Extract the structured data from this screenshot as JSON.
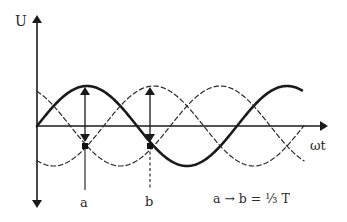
{
  "diagram": {
    "axes": {
      "y_label": "U",
      "x_label": "ωt",
      "origin": {
        "x": 37,
        "y": 126
      },
      "y_top": 15,
      "y_bottom": 208,
      "x_end": 328
    },
    "curves": [
      {
        "name": "phase-1",
        "style": "solid",
        "phase_deg": 0,
        "amplitude_px": 40,
        "period_px": 200,
        "x_start": 37,
        "x_end": 302,
        "color": "#1a1a1a",
        "width": 2.6
      },
      {
        "name": "phase-2",
        "style": "dashed",
        "phase_deg": 120,
        "amplitude_px": 40,
        "period_px": 200,
        "x_start": 37,
        "x_end": 304,
        "color": "#2a2a2a",
        "width": 1.2
      },
      {
        "name": "phase-3",
        "style": "dashed",
        "phase_deg": -120,
        "amplitude_px": 40,
        "period_px": 200,
        "x_start": 37,
        "x_end": 304,
        "color": "#2a2a2a",
        "width": 1.2
      }
    ],
    "markers": [
      {
        "label": "a",
        "x": 85,
        "dot_y": 146,
        "arrow_top": 86,
        "arrow_bottom": 142,
        "line_bottom": 190,
        "line_style": "solid"
      },
      {
        "label": "b",
        "x": 150,
        "dot_y": 146,
        "arrow_top": 86,
        "arrow_bottom": 142,
        "line_bottom": 190,
        "line_style": "dashed"
      }
    ],
    "formula": "a → b = ⅓ T"
  }
}
